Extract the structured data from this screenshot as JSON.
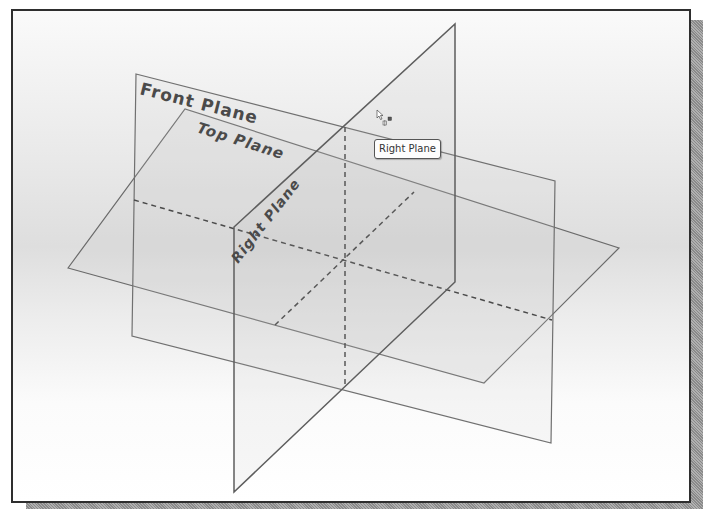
{
  "viewport": {
    "type": "3d-graphics-area",
    "background": "gradient-gray"
  },
  "planes": [
    {
      "id": "front",
      "label": "Front Plane",
      "selected": false
    },
    {
      "id": "top",
      "label": "Top Plane",
      "selected": false
    },
    {
      "id": "right",
      "label": "Right Plane",
      "selected": false,
      "hovered": true
    }
  ],
  "tooltip": {
    "text": "Right Plane"
  },
  "cursor": {
    "icon": "arrow-pointer-with-plane-select-icon"
  },
  "colors": {
    "plane_edge": "#6a6a6a",
    "dashed_axis": "#4a4a4a",
    "frame_border": "#2e2e2e",
    "select_marker": "#555555"
  }
}
